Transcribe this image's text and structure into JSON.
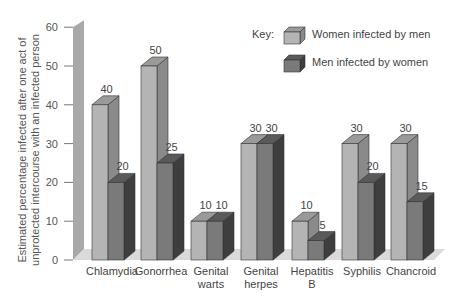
{
  "chart_data": {
    "type": "bar",
    "title": "",
    "xlabel": "",
    "ylabel": "Estimated percentage infected after one act of unprotected intercourse with an infected person",
    "ylabel_lines": [
      "Estimated percentage infected after one act of",
      "unprotected intercourse with an infected person"
    ],
    "ylim": [
      0,
      60
    ],
    "yticks": [
      0,
      10,
      20,
      30,
      40,
      50,
      60
    ],
    "grid": false,
    "legend_position": "top-right",
    "legend_title": "Key:",
    "categories": [
      "Chlamydia",
      "Gonorrhea",
      "Genital warts",
      "Genital herpes",
      "Hepatitis B",
      "Syphilis",
      "Chancroid"
    ],
    "category_lines": [
      [
        "Chlamydia"
      ],
      [
        "Gonorrhea"
      ],
      [
        "Genital",
        "warts"
      ],
      [
        "Genital",
        "herpes"
      ],
      [
        "Hepatitis",
        "B"
      ],
      [
        "Syphilis"
      ],
      [
        "Chancroid"
      ]
    ],
    "series": [
      {
        "name": "Women infected by men",
        "values": [
          40,
          50,
          10,
          30,
          10,
          30,
          30
        ],
        "color": "#b4b4b4",
        "top": "#9a9a9a",
        "side": "#8a8a8a"
      },
      {
        "name": "Men infected by women",
        "values": [
          20,
          25,
          10,
          30,
          5,
          20,
          15
        ],
        "color": "#7a7a7a",
        "top": "#5a5a5a",
        "side": "#3e3e3e"
      }
    ]
  }
}
